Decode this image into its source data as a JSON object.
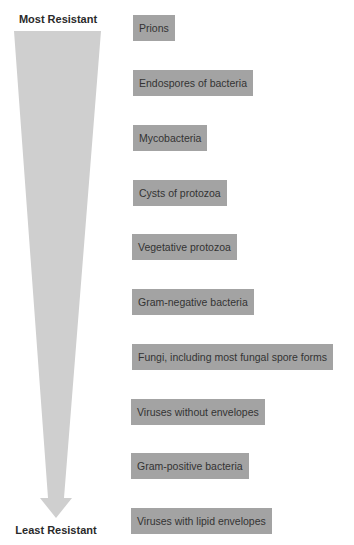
{
  "diagram": {
    "top_label": "Most Resistant",
    "bottom_label": "Least Resistant",
    "colors": {
      "box_fill": "#a3a3a3",
      "box_text": "#333333",
      "arrow_fill": "#cfcfcf",
      "label_text": "#2a2a2a"
    },
    "items": [
      {
        "label": "Prions",
        "rank": 1
      },
      {
        "label": "Endospores of bacteria",
        "rank": 2
      },
      {
        "label": "Mycobacteria",
        "rank": 3
      },
      {
        "label": "Cysts of protozoa",
        "rank": 4
      },
      {
        "label": "Vegetative protozoa",
        "rank": 5
      },
      {
        "label": "Gram-negative bacteria",
        "rank": 6
      },
      {
        "label": "Fungi, including most fungal spore forms",
        "rank": 7
      },
      {
        "label": "Viruses without envelopes",
        "rank": 8
      },
      {
        "label": "Gram-positive bacteria",
        "rank": 9
      },
      {
        "label": "Viruses with lipid envelopes",
        "rank": 10
      }
    ]
  }
}
